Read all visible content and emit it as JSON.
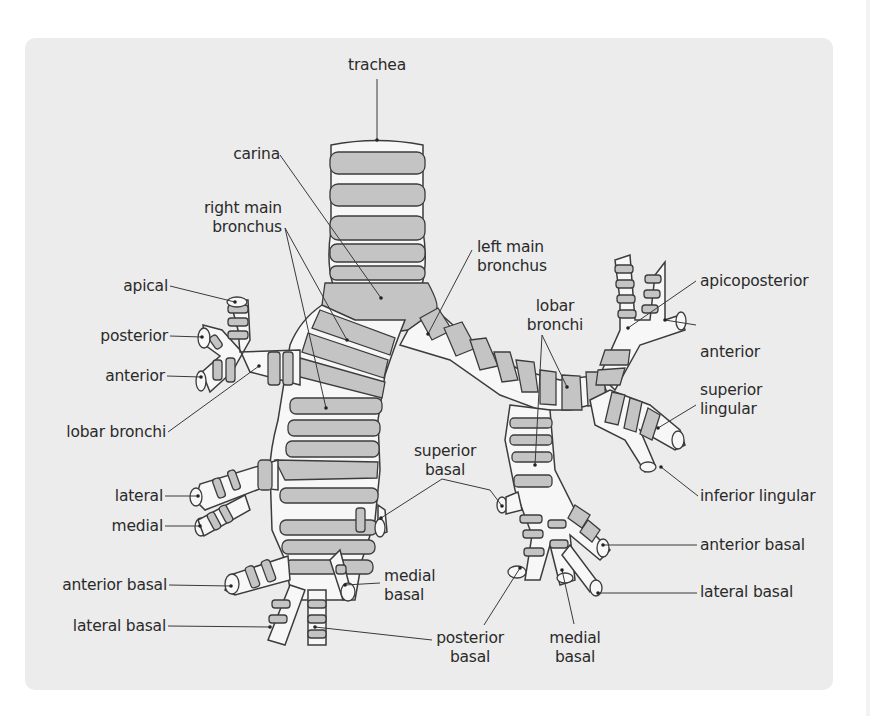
{
  "figure": {
    "background_color": "#ffffff",
    "panel_color": "#ececec",
    "cartilage_color": "#c4c4c4",
    "lumen_color": "#f7f7f7",
    "outline_color": "#3c3c3c"
  },
  "labels": {
    "trachea": "trachea",
    "carina": "carina",
    "right_main_bronchus": "right main\nbronchus",
    "left_main_bronchus": "left main\nbronchus",
    "right_upper": {
      "apical": "apical",
      "posterior": "posterior",
      "anterior": "anterior",
      "lobar_bronchi": "lobar bronchi"
    },
    "right_middle": {
      "lateral": "lateral",
      "medial": "medial"
    },
    "right_lower": {
      "anterior_basal": "anterior basal",
      "lateral_basal": "lateral basal",
      "medial_basal": "medial\nbasal",
      "superior_basal": "superior\nbasal",
      "posterior_basal": "posterior\nbasal"
    },
    "left_lobar_bronchi": "lobar\nbronchi",
    "left_upper": {
      "apicoposterior": "apicoposterior",
      "anterior": "anterior",
      "superior_lingular": "superior\nlingular",
      "inferior_lingular": "inferior lingular"
    },
    "left_lower": {
      "anterior_basal": "anterior basal",
      "lateral_basal": "lateral basal",
      "medial_basal": "medial\nbasal"
    }
  }
}
